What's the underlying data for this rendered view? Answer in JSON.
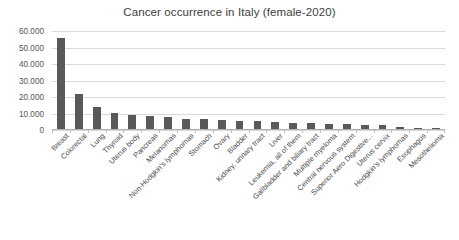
{
  "chart_data": {
    "type": "bar",
    "title": "Cancer occurrence  in Italy (female-2020)",
    "xlabel": "",
    "ylabel": "",
    "ylim": [
      0,
      60000
    ],
    "grid": true,
    "legend": "none",
    "y_ticks": [
      "60.000",
      "50.000",
      "40.000",
      "30.000",
      "20.000",
      "10.000",
      "0"
    ],
    "y_tick_values": [
      60000,
      50000,
      40000,
      30000,
      20000,
      10000,
      0
    ],
    "bar_color": "#595959",
    "categories": [
      "Breast",
      "Colorectal",
      "Lung",
      "Thyroid",
      "Uterus body",
      "Pancreas",
      "Melanomas",
      "Non-Hodgkin's lymphomas",
      "Stomach",
      "Ovary",
      "Bladder",
      "Kidney, urinary tract",
      "Liver",
      "Leukemia, all of them",
      "Gallbladder and biliary tract",
      "Multiple myeloma",
      "Central nervous system",
      "Superior Aero Digestive...",
      "Uterus cervix",
      "Hodgkin's lymphomas",
      "Esophagus",
      "Mesothelioma"
    ],
    "values": [
      55000,
      21000,
      13500,
      10000,
      8700,
      7600,
      7000,
      6300,
      5800,
      5200,
      5000,
      4600,
      4100,
      3800,
      3500,
      3100,
      2900,
      2700,
      2500,
      1200,
      900,
      700
    ]
  }
}
